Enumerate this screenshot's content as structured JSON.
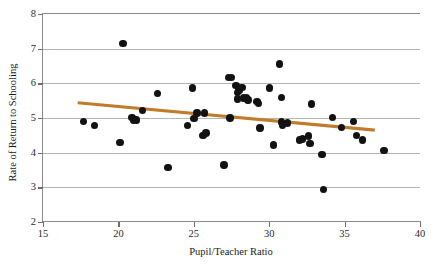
{
  "chart_data": {
    "type": "scatter",
    "title": "",
    "xlabel": "Pupil/Teacher Ratio",
    "ylabel": "Rate of Return to Schooling",
    "xlim": [
      15,
      40
    ],
    "ylim": [
      2,
      8
    ],
    "xticks": [
      15,
      20,
      25,
      30,
      35,
      40
    ],
    "yticks": [
      2,
      3,
      4,
      5,
      6,
      7,
      8
    ],
    "grid": "horizontal",
    "legend": "none",
    "marker_color": "#121212",
    "trendline_color": "#C07C2B",
    "grid_color": "#b4b4b4",
    "axis_color": "#8c8c8c",
    "series": [
      {
        "name": "Rate of Return to Schooling",
        "marker": "filled-circle",
        "points": [
          [
            17.7,
            4.9
          ],
          [
            18.4,
            4.79
          ],
          [
            20.1,
            4.3
          ],
          [
            20.3,
            7.15
          ],
          [
            20.9,
            5.02
          ],
          [
            21.0,
            4.92
          ],
          [
            21.2,
            4.94
          ],
          [
            21.6,
            5.21
          ],
          [
            22.6,
            5.7
          ],
          [
            23.3,
            3.57
          ],
          [
            24.6,
            4.79
          ],
          [
            24.9,
            5.86
          ],
          [
            25.0,
            4.98
          ],
          [
            25.2,
            5.14
          ],
          [
            25.6,
            4.5
          ],
          [
            25.7,
            5.15
          ],
          [
            25.8,
            4.57
          ],
          [
            27.0,
            3.65
          ],
          [
            27.3,
            6.17
          ],
          [
            27.5,
            6.16
          ],
          [
            27.4,
            5.0
          ],
          [
            27.8,
            5.93
          ],
          [
            27.9,
            5.73
          ],
          [
            28.0,
            5.8
          ],
          [
            27.9,
            5.55
          ],
          [
            28.2,
            5.88
          ],
          [
            28.3,
            5.58
          ],
          [
            28.5,
            5.59
          ],
          [
            28.6,
            5.52
          ],
          [
            29.2,
            5.47
          ],
          [
            29.3,
            5.41
          ],
          [
            29.4,
            4.71
          ],
          [
            30.0,
            5.87
          ],
          [
            30.3,
            4.22
          ],
          [
            30.7,
            6.56
          ],
          [
            30.8,
            4.89
          ],
          [
            30.9,
            4.8
          ],
          [
            30.8,
            5.6
          ],
          [
            31.2,
            4.86
          ],
          [
            32.0,
            4.37
          ],
          [
            32.2,
            4.39
          ],
          [
            32.6,
            4.48
          ],
          [
            32.7,
            4.26
          ],
          [
            32.8,
            5.4
          ],
          [
            33.5,
            3.94
          ],
          [
            33.6,
            2.94
          ],
          [
            34.2,
            5.02
          ],
          [
            34.8,
            4.73
          ],
          [
            35.6,
            4.9
          ],
          [
            35.8,
            4.49
          ],
          [
            36.2,
            4.36
          ],
          [
            37.6,
            4.06
          ]
        ]
      }
    ],
    "trendline": {
      "name": "fitted regression line",
      "x_start": 17.3,
      "y_start": 5.44,
      "x_end": 37.0,
      "y_end": 4.65
    }
  }
}
